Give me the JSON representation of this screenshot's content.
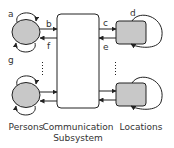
{
  "diagram": {
    "nodes": {
      "persons_top": {
        "shape": "ellipse",
        "fill": "#c8c8c8"
      },
      "persons_bottom": {
        "shape": "ellipse",
        "fill": "#c8c8c8"
      },
      "comm": {
        "shape": "rounded-rect",
        "fill": "#ffffff"
      },
      "loc_top": {
        "shape": "rounded-rect",
        "fill": "#c8c8c8"
      },
      "loc_bottom": {
        "shape": "rounded-rect",
        "fill": "#c8c8c8"
      }
    },
    "edge_labels": {
      "a": "a",
      "b": "b",
      "c": "c",
      "d": "d",
      "e": "e",
      "f": "f",
      "g": "g"
    },
    "labels": {
      "persons": "Persons",
      "comm_line1": "Communication",
      "comm_line2": "Subsystem",
      "locations": "Locations"
    },
    "colors": {
      "stroke": "#222222",
      "node_fill": "#c8c8c8",
      "text": "#333333"
    }
  }
}
